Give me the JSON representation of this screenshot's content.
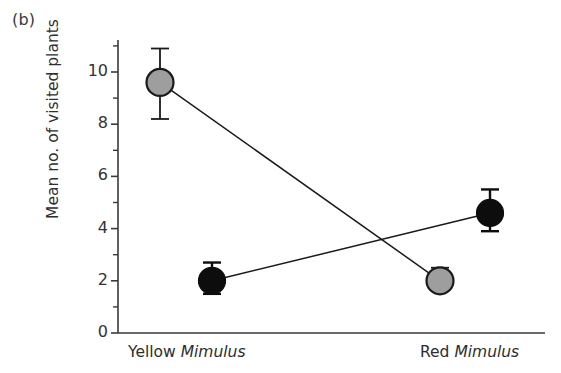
{
  "figure": {
    "panel_label": "(b)",
    "background_color": "#ffffff"
  },
  "chart_data": {
    "type": "line",
    "title": "",
    "subtitle": "",
    "xlabel": "",
    "ylabel": "Mean no. of visited plants",
    "categories": [
      "Yellow Mimulus",
      "Red Mimulus"
    ],
    "category_labels_html": [
      {
        "plain": "Yellow ",
        "italic": "Mimulus"
      },
      {
        "plain": "Red ",
        "italic": "Mimulus"
      }
    ],
    "ylim": [
      0,
      11
    ],
    "ytick_values": [
      0,
      2,
      4,
      6,
      8,
      10
    ],
    "ytick_labels": [
      "0",
      "2",
      "4",
      "6",
      "8",
      "10"
    ],
    "yminor_tick_values": [
      1,
      3,
      5,
      7,
      9,
      11
    ],
    "grid": false,
    "legend": "none",
    "legend_position": "none",
    "series": [
      {
        "name": "grey-marker-series",
        "marker": "filled-circle",
        "marker_face_color": "#9e9e9e",
        "marker_edge_color": "#1a1a1a",
        "line_color": "#1a1a1a",
        "values": [
          9.6,
          2.0
        ],
        "error_upper": [
          10.9,
          2.5
        ],
        "error_lower": [
          8.2,
          1.8
        ]
      },
      {
        "name": "black-marker-series",
        "marker": "filled-circle",
        "marker_face_color": "#0d0d0d",
        "marker_edge_color": "#0d0d0d",
        "line_color": "#1a1a1a",
        "values": [
          2.0,
          4.6
        ],
        "error_upper": [
          2.7,
          5.5
        ],
        "error_lower": [
          1.5,
          3.9
        ]
      }
    ],
    "axis_color": "#3a3a3a"
  }
}
